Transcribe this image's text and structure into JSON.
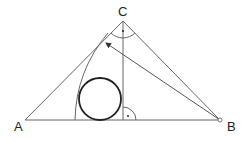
{
  "diagram": {
    "type": "geometry",
    "points": {
      "A": {
        "label": "A",
        "x": 25,
        "y": 120
      },
      "B": {
        "label": "B",
        "x": 220,
        "y": 120
      },
      "C": {
        "label": "C",
        "x": 123,
        "y": 21
      },
      "H": {
        "label": "",
        "x": 123,
        "y": 120
      }
    },
    "incircle": {
      "cx": 100,
      "cy": 99,
      "r": 21
    },
    "arc_from_B_radius_BC": true,
    "arrow": {
      "from": "B",
      "to_x": 105,
      "to_y": 42
    },
    "right_angle_marks": [
      "C",
      "H"
    ],
    "labels": {
      "A": "A",
      "B": "B",
      "C": "C"
    },
    "colors": {
      "line": "#555555",
      "circle": "#222222"
    }
  }
}
